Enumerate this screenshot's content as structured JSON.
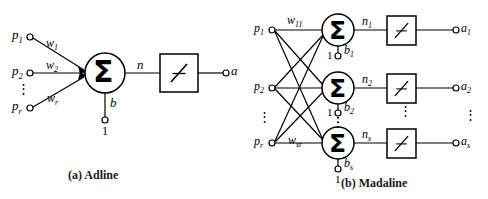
{
  "figure": {
    "background_color": "#ffffff",
    "stroke_color": "#000000"
  },
  "panel_a": {
    "caption": "(a)  Adline",
    "inputs": [
      {
        "base": "p",
        "sub": "1"
      },
      {
        "base": "p",
        "sub": "2"
      },
      {
        "base": "p",
        "sub": "r"
      }
    ],
    "input_dots": "⋮",
    "weights": [
      {
        "base": "w",
        "sub": "1"
      },
      {
        "base": "w",
        "sub": "2"
      },
      {
        "base": "w",
        "sub": "r"
      }
    ],
    "sum_symbol": "Σ",
    "net_label": {
      "base": "n",
      "sub": ""
    },
    "bias_label": {
      "base": "b",
      "sub": ""
    },
    "bias_input_value": "1",
    "transfer_icon": "linear-transfer-icon",
    "output_label": {
      "base": "a",
      "sub": ""
    }
  },
  "panel_b": {
    "caption": "(b)  Madaline",
    "inputs": [
      {
        "base": "p",
        "sub": "1"
      },
      {
        "base": "p",
        "sub": "2"
      },
      {
        "base": "p",
        "sub": "r"
      }
    ],
    "input_dots": "⋮",
    "weights": [
      {
        "base": "w",
        "sub": "11"
      },
      {
        "base": "w",
        "sub": "sr"
      }
    ],
    "sum_symbol": "Σ",
    "net_labels": [
      {
        "base": "n",
        "sub": "1"
      },
      {
        "base": "n",
        "sub": "2"
      },
      {
        "base": "n",
        "sub": "s"
      }
    ],
    "bias_labels": [
      {
        "base": "b",
        "sub": "1"
      },
      {
        "base": "b",
        "sub": "2"
      },
      {
        "base": "b",
        "sub": "s"
      }
    ],
    "bias_input_value": "1",
    "transfer_icon": "linear-transfer-icon",
    "output_labels": [
      {
        "base": "a",
        "sub": "1"
      },
      {
        "base": "a",
        "sub": "2"
      },
      {
        "base": "a",
        "sub": "s"
      }
    ],
    "neuron_dots": "⋮",
    "output_dots": "⋮"
  }
}
